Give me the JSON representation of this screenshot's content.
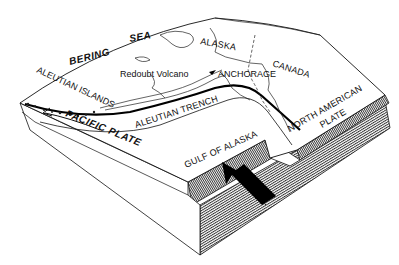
{
  "diagram": {
    "type": "block-diagram",
    "style": "black-and-white line drawing",
    "colors": {
      "ink": "#111111",
      "background": "#ffffff",
      "arrow": "#000000"
    },
    "labels": {
      "bering": "BERING",
      "sea": "SEA",
      "alaska": "ALASKA",
      "canada": "CANADA",
      "aleutian_islands": "ALEUTIAN ISLANDS",
      "redoubt_volcano": "Redoubt Volcano",
      "anchorage": "ANCHORAGE",
      "aleutian_trench": "ALEUTIAN TRENCH",
      "pacific_plate": "PACIFIC PLATE",
      "gulf_of_alaska": "GULF OF ALASKA",
      "north_american": "NORTH AMERICAN",
      "plate": "PLATE"
    },
    "arrows": [
      {
        "name": "pacific-plate-motion-arrow",
        "direction": "west / left along the plate",
        "style": "outlined curved arrow"
      },
      {
        "name": "subduction-direction-arrow",
        "direction": "northwest toward the trench",
        "style": "solid black block arrow"
      }
    ]
  }
}
